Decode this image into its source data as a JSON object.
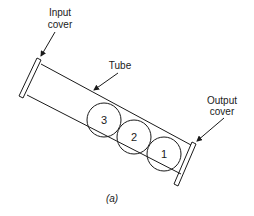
{
  "diagram": {
    "labels": {
      "input_cover_line1": "Input",
      "input_cover_line2": "cover",
      "tube": "Tube",
      "output_cover_line1": "Output",
      "output_cover_line2": "cover"
    },
    "balls": [
      {
        "id": "3",
        "label": "3"
      },
      {
        "id": "2",
        "label": "2"
      },
      {
        "id": "1",
        "label": "1"
      }
    ],
    "caption": "(a)"
  }
}
